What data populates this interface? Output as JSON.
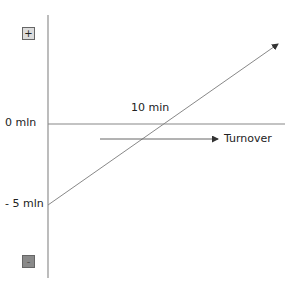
{
  "diagram": {
    "y_labels": {
      "zero": "0 mln",
      "minus_five": "- 5 mln"
    },
    "crossing_label": "10 min",
    "arrow_label": "Turnover",
    "buttons": {
      "plus": "+",
      "minus": "-"
    },
    "colors": {
      "line": "#888888",
      "axis": "#999999",
      "plus_bg": "#dcdcdc",
      "minus_bg": "#8a8a8a"
    }
  }
}
